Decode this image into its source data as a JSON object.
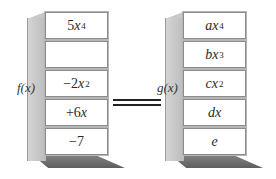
{
  "left_stack": {
    "label": "f(x)",
    "terms": [
      {
        "coef": "5",
        "var": "x",
        "exp": "4"
      },
      {
        "coef": "",
        "var": "",
        "exp": ""
      },
      {
        "coef": "−2",
        "var": "x",
        "exp": "2"
      },
      {
        "coef": "+6",
        "var": "x",
        "exp": ""
      },
      {
        "coef": "−7",
        "var": "",
        "exp": ""
      }
    ]
  },
  "right_stack": {
    "label": "g(x)",
    "terms": [
      {
        "coef": "a",
        "var": "x",
        "exp": "4"
      },
      {
        "coef": "b",
        "var": "x",
        "exp": "3"
      },
      {
        "coef": "c",
        "var": "x",
        "exp": "2"
      },
      {
        "coef": "d",
        "var": "x",
        "exp": ""
      },
      {
        "coef": "e",
        "var": "",
        "exp": ""
      }
    ]
  },
  "relation": "equals"
}
